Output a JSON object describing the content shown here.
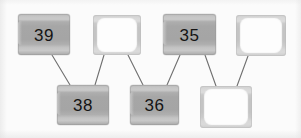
{
  "diagram": {
    "type": "tree-diagram",
    "title": "",
    "background_color": "#fbfbfb",
    "node_fill_color": "#a8a8a8",
    "node_empty_color": "#fdfdfd",
    "node_frame_color": "#c7c7c7",
    "edge_color": "#6f6f6f",
    "label_color": "#141414"
  },
  "nodes": [
    {
      "id": "n1",
      "label": "39",
      "state": "filled",
      "row": "top",
      "x": 18,
      "y": 14,
      "w": 52,
      "h": 41
    },
    {
      "id": "n2",
      "label": "",
      "state": "empty",
      "row": "top",
      "x": 93,
      "y": 15,
      "w": 48,
      "h": 40
    },
    {
      "id": "n3",
      "label": "35",
      "state": "filled",
      "row": "top",
      "x": 163,
      "y": 14,
      "w": 53,
      "h": 41
    },
    {
      "id": "n4",
      "label": "",
      "state": "empty",
      "row": "top",
      "x": 236,
      "y": 15,
      "w": 50,
      "h": 41
    },
    {
      "id": "n5",
      "label": "38",
      "state": "filled",
      "row": "bottom",
      "x": 57,
      "y": 85,
      "w": 52,
      "h": 40
    },
    {
      "id": "n6",
      "label": "36",
      "state": "filled",
      "row": "bottom",
      "x": 130,
      "y": 85,
      "w": 49,
      "h": 40
    },
    {
      "id": "n7",
      "label": "",
      "state": "empty",
      "row": "bottom",
      "x": 200,
      "y": 86,
      "w": 52,
      "h": 42
    }
  ],
  "edges": [
    {
      "id": "e1",
      "from": "n1",
      "to": "n5",
      "x1": 52,
      "y1": 55,
      "x2": 70,
      "y2": 85
    },
    {
      "id": "e2",
      "from": "n2",
      "to": "n5",
      "x1": 104,
      "y1": 55,
      "x2": 95,
      "y2": 85
    },
    {
      "id": "e3",
      "from": "n2",
      "to": "n6",
      "x1": 128,
      "y1": 55,
      "x2": 143,
      "y2": 85
    },
    {
      "id": "e4",
      "from": "n3",
      "to": "n6",
      "x1": 180,
      "y1": 55,
      "x2": 167,
      "y2": 85
    },
    {
      "id": "e5",
      "from": "n3",
      "to": "n7",
      "x1": 205,
      "y1": 55,
      "x2": 216,
      "y2": 86
    },
    {
      "id": "e6",
      "from": "n4",
      "to": "n7",
      "x1": 248,
      "y1": 56,
      "x2": 237,
      "y2": 86
    }
  ]
}
